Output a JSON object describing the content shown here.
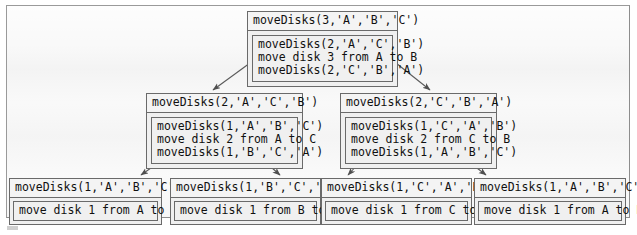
{
  "figure": {
    "frame_color": "#9a9a9a",
    "frame_background": "#f2f2f2",
    "node_border_color": "#6a6a6a",
    "node_background": "#f0f0f0",
    "arrow_color": "#5a5a5a"
  },
  "tree": {
    "root": {
      "header": "moveDisks(3,'A','B','C')",
      "body": [
        "moveDisks(2,'A','C','B')",
        "move disk 3 from A to B",
        "moveDisks(2,'C','B','A')"
      ]
    },
    "level1": [
      {
        "header": "moveDisks(2,'A','C','B')",
        "body": [
          "moveDisks(1,'A','B','C')",
          "move disk 2 from A to C",
          "moveDisks(1,'B','C','A')"
        ]
      },
      {
        "header": "moveDisks(2,'C','B','A')",
        "body": [
          "moveDisks(1,'C','A','B')",
          "move disk 2 from C to B",
          "moveDisks(1,'A','B','C')"
        ]
      }
    ],
    "leaves": [
      {
        "header": "moveDisks(1,'A','B','C')",
        "body": [
          "move disk 1 from A to B"
        ]
      },
      {
        "header": "moveDisks(1,'B','C','A')",
        "body": [
          "move disk 1 from B to C"
        ]
      },
      {
        "header": "moveDisks(1,'C','A','B')",
        "body": [
          "move disk 1 from C to A"
        ]
      },
      {
        "header": "moveDisks(1,'A','B','C')",
        "body": [
          "move disk 1 from A to B"
        ]
      }
    ]
  }
}
